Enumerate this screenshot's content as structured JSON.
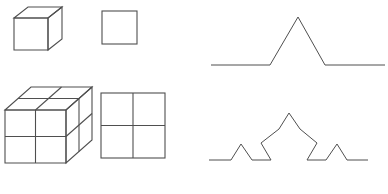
{
  "figure": {
    "background_color": "#ffffff",
    "stroke_color": "#4f4f4f",
    "width": 388,
    "height": 194,
    "panels": [
      {
        "name": "cube-unit",
        "label": "Unit cube (3D)",
        "kind": "isometric-cube",
        "subdivisions": 1,
        "geometry": {
          "front": [
            [
              14,
              18
            ],
            [
              48,
              18
            ],
            [
              48,
              50
            ],
            [
              14,
              50
            ]
          ],
          "top": [
            [
              14,
              18
            ],
            [
              28,
              7
            ],
            [
              62,
              7
            ],
            [
              48,
              18
            ]
          ],
          "right": [
            [
              48,
              18
            ],
            [
              62,
              7
            ],
            [
              62,
              39
            ],
            [
              48,
              50
            ]
          ]
        }
      },
      {
        "name": "square-unit",
        "label": "Unit square (2D)",
        "kind": "square",
        "subdivisions": 1,
        "geometry": {
          "rect": [
            102,
            11,
            35,
            33
          ]
        }
      },
      {
        "name": "cube-subdivided",
        "label": "Cube scaled by 2 (8 copies)",
        "kind": "isometric-cube",
        "subdivisions": 2,
        "geometry": {
          "front": [
            [
              5,
              110
            ],
            [
              66,
              110
            ],
            [
              66,
              163
            ],
            [
              5,
              163
            ]
          ],
          "top": [
            [
              5,
              110
            ],
            [
              31,
              87
            ],
            [
              92,
              87
            ],
            [
              66,
              110
            ]
          ],
          "right": [
            [
              66,
              110
            ],
            [
              92,
              87
            ],
            [
              92,
              140
            ],
            [
              66,
              163
            ]
          ]
        }
      },
      {
        "name": "square-subdivided",
        "label": "Square scaled by 2 (4 copies)",
        "kind": "square",
        "subdivisions": 2,
        "geometry": {
          "rect": [
            101,
            93,
            64,
            65
          ]
        }
      },
      {
        "name": "koch-curve-iteration-1",
        "label": "Koch curve, iteration 1",
        "kind": "koch-curve",
        "iteration": 1,
        "geometry": {
          "points": "211,65 270,65 298,17 325,65 385,65"
        }
      },
      {
        "name": "koch-curve-iteration-2",
        "label": "Koch curve, iteration 2",
        "kind": "koch-curve",
        "iteration": 2,
        "geometry": {
          "points": "209,160 231,160 241,144 252,160 271,160 261,143 279,129 289,113 300,129 317,143 307,160 326,160 337,144 347,160 368,160"
        }
      }
    ]
  }
}
